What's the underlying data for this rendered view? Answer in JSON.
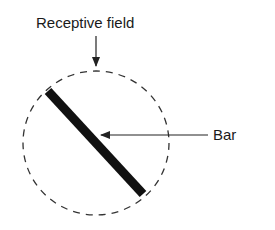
{
  "diagram": {
    "labels": {
      "receptive_field": "Receptive field",
      "bar": "Bar"
    },
    "receptive_field": {
      "cx": 96,
      "cy": 143,
      "rx": 74,
      "ry": 72,
      "style": "dashed"
    },
    "bar": {
      "x1": 48,
      "y1": 91,
      "x2": 144,
      "y2": 194,
      "width": 9,
      "color": "#111111"
    },
    "arrows": [
      {
        "from": "Receptive field",
        "to": "circle top",
        "direction": "down"
      },
      {
        "from": "Bar",
        "to": "bar center",
        "direction": "left"
      }
    ]
  }
}
